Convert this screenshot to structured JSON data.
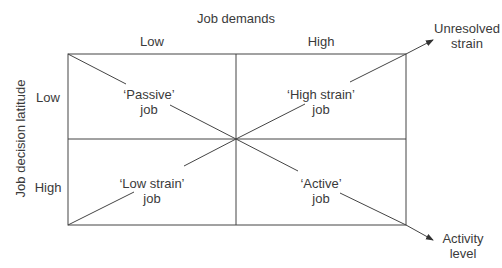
{
  "diagram": {
    "title": "Job demands",
    "x_axis": {
      "label": "Job demands",
      "ticks": [
        "Low",
        "High"
      ]
    },
    "y_axis": {
      "label": "Job decision latitude",
      "ticks": [
        "Low",
        "High"
      ]
    },
    "quadrants": [
      {
        "line1": "‘Passive’",
        "line2": "job"
      },
      {
        "line1": "‘High strain’",
        "line2": "job"
      },
      {
        "line1": "‘Low strain’",
        "line2": "job"
      },
      {
        "line1": "‘Active’",
        "line2": "job"
      }
    ],
    "arrows": [
      {
        "line1": "Unresolved",
        "line2": "strain"
      },
      {
        "line1": "Activity",
        "line2": "level"
      }
    ],
    "line_color": "#444444"
  }
}
